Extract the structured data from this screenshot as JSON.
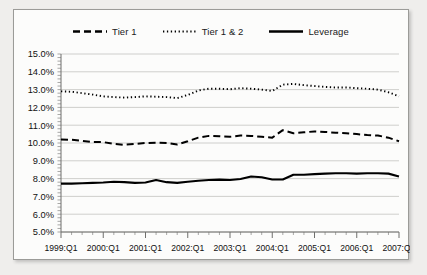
{
  "chart_data": {
    "type": "line",
    "title": "",
    "subtitle": "",
    "xlabel": "",
    "ylabel": "",
    "ylim": [
      5.0,
      15.0
    ],
    "ytick_step": 1.0,
    "ytick_labels": [
      "15.0%",
      "14.0%",
      "13.0%",
      "12.0%",
      "11.0%",
      "10.0%",
      "9.0%",
      "8.0%",
      "7.0%",
      "6.0%",
      "5.0%"
    ],
    "ytick_values": [
      15.0,
      14.0,
      13.0,
      12.0,
      11.0,
      10.0,
      9.0,
      8.0,
      7.0,
      6.0,
      5.0
    ],
    "grid": true,
    "grid_axis": "y",
    "legend_position": "top",
    "x": [
      "1999:Q1",
      "1999:Q2",
      "1999:Q3",
      "1999:Q4",
      "2000:Q1",
      "2000:Q2",
      "2000:Q3",
      "2000:Q4",
      "2001:Q1",
      "2001:Q2",
      "2001:Q3",
      "2001:Q4",
      "2002:Q1",
      "2002:Q2",
      "2002:Q3",
      "2002:Q4",
      "2003:Q1",
      "2003:Q2",
      "2003:Q3",
      "2003:Q4",
      "2004:Q1",
      "2004:Q2",
      "2004:Q3",
      "2004:Q4",
      "2005:Q1",
      "2005:Q2",
      "2005:Q3",
      "2005:Q4",
      "2006:Q1",
      "2006:Q2",
      "2006:Q3",
      "2006:Q4",
      "2007:Q1"
    ],
    "xtick_labels": [
      "1999:Q1",
      "2000:Q1",
      "2001:Q1",
      "2002:Q1",
      "2003:Q1",
      "2004:Q1",
      "2005:Q1",
      "2006:Q1",
      "2007:Q1"
    ],
    "xtick_indices": [
      0,
      4,
      8,
      12,
      16,
      20,
      24,
      28,
      32
    ],
    "series": [
      {
        "name": "Tier 1",
        "style": "dashed",
        "color": "#000000",
        "values": [
          10.2,
          10.18,
          10.12,
          10.05,
          10.05,
          9.95,
          9.9,
          9.95,
          10.0,
          10.02,
          10.0,
          9.92,
          10.1,
          10.3,
          10.4,
          10.38,
          10.35,
          10.42,
          10.4,
          10.35,
          10.3,
          10.72,
          10.55,
          10.6,
          10.65,
          10.62,
          10.58,
          10.55,
          10.5,
          10.45,
          10.42,
          10.3,
          10.1
        ]
      },
      {
        "name": "Tier 1 & 2",
        "style": "dotted",
        "color": "#000000",
        "values": [
          12.9,
          12.88,
          12.8,
          12.72,
          12.62,
          12.58,
          12.55,
          12.58,
          12.62,
          12.6,
          12.58,
          12.52,
          12.7,
          12.95,
          13.05,
          13.05,
          13.02,
          13.08,
          13.05,
          13.0,
          12.92,
          13.28,
          13.32,
          13.25,
          13.2,
          13.15,
          13.12,
          13.12,
          13.08,
          13.05,
          13.0,
          12.85,
          12.62
        ]
      },
      {
        "name": "Leverage",
        "style": "solid",
        "color": "#000000",
        "values": [
          7.72,
          7.72,
          7.74,
          7.76,
          7.78,
          7.82,
          7.8,
          7.76,
          7.78,
          7.92,
          7.8,
          7.76,
          7.82,
          7.88,
          7.92,
          7.94,
          7.92,
          7.98,
          8.12,
          8.08,
          7.95,
          7.95,
          8.22,
          8.22,
          8.25,
          8.28,
          8.3,
          8.3,
          8.28,
          8.3,
          8.3,
          8.28,
          8.12
        ]
      }
    ]
  },
  "legend": {
    "entries": [
      {
        "label": "Tier 1",
        "style": "dashed"
      },
      {
        "label": "Tier 1 & 2",
        "style": "dotted"
      },
      {
        "label": "Leverage",
        "style": "solid"
      }
    ]
  },
  "colors": {
    "background": "#efeeec",
    "panel": "#fcfcfb",
    "border": "#9b9b98",
    "gridline": "#c9c9c6",
    "axis": "#6f6f6d",
    "line": "#000000",
    "text": "#111111"
  }
}
